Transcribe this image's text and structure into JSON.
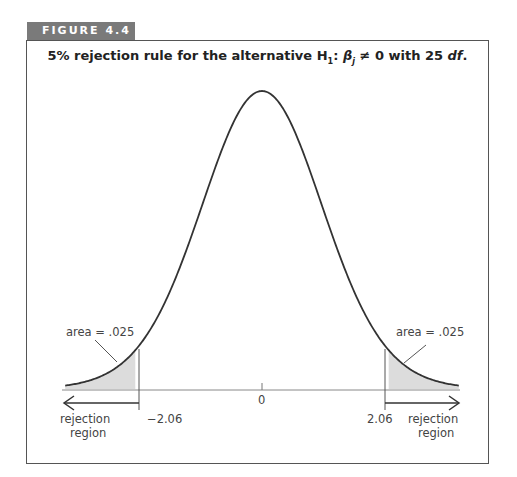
{
  "figure": {
    "label": "FIGURE 4.4",
    "title_prefix": "5% rejection rule for the alternative H",
    "title_h_sub": "1",
    "title_colon": ": ",
    "title_beta": "β",
    "title_beta_sub": "j",
    "title_mid": " ≠ 0 with 25 ",
    "title_df": "df",
    "title_end": "."
  },
  "annotations": {
    "left_area": "area = .025",
    "right_area": "area = .025",
    "left_critical": "−2.06",
    "right_critical": "2.06",
    "center": "0",
    "left_region_line1": "rejection",
    "left_region_line2": "region",
    "right_region_line1": "rejection",
    "right_region_line2": "region"
  },
  "colors": {
    "tab_bg": "#7a7a7a",
    "shade": "#dcdcdc",
    "curve": "#333333",
    "axis": "#777777"
  },
  "chart_data": {
    "type": "area",
    "title": "5% rejection rule for the alternative H1: βj ≠ 0 with 25 df.",
    "distribution": "Student t",
    "df": 25,
    "alpha": 0.05,
    "tails": "two-sided",
    "critical_values": [
      -2.06,
      2.06
    ],
    "tail_area_each": 0.025,
    "shaded_regions": [
      {
        "from": -4,
        "to": -2.06,
        "area": 0.025,
        "label": "area = .025"
      },
      {
        "from": 2.06,
        "to": 4,
        "area": 0.025,
        "label": "area = .025"
      }
    ],
    "x_ticks": [
      -2.06,
      0,
      2.06
    ],
    "x_tick_labels": [
      "−2.06",
      "0",
      "2.06"
    ],
    "region_labels": [
      "rejection region",
      "rejection region"
    ],
    "xlim": [
      -4,
      4
    ],
    "xlabel": "",
    "ylabel": "",
    "grid": false
  }
}
